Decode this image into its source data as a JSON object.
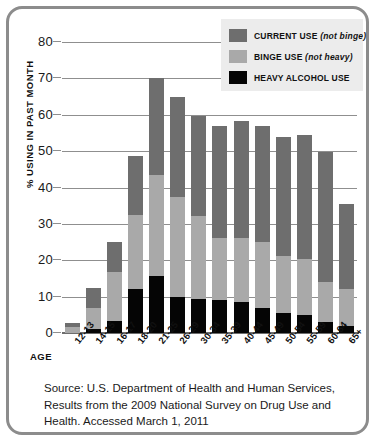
{
  "chart_data": {
    "type": "bar",
    "stacked": true,
    "title": "",
    "xlabel": "AGE",
    "ylabel": "% USING IN PAST MONTH",
    "ylim": [
      0,
      80
    ],
    "yticks": [
      0,
      10,
      20,
      30,
      40,
      50,
      60,
      70,
      80
    ],
    "grid": true,
    "legend_position": "top-right",
    "categories": [
      "12-13",
      "14-15",
      "16-17",
      "18-20",
      "21-25",
      "26-29",
      "30-34",
      "35-39",
      "40-44",
      "45-49",
      "50-54",
      "55-59",
      "60-64",
      "65+"
    ],
    "series": [
      {
        "name": "HEAVY ALCOHOL USE",
        "color": "#050505",
        "values": [
          0.0,
          1.2,
          3.2,
          12.0,
          15.8,
          9.8,
          9.3,
          9.0,
          8.5,
          7.0,
          5.6,
          4.9,
          3.1,
          1.8
        ]
      },
      {
        "name": "BINGE USE",
        "note": "(not heavy)",
        "color": "#a9a9a9",
        "values": [
          1.6,
          5.6,
          13.5,
          20.5,
          27.7,
          27.7,
          22.9,
          17.2,
          17.6,
          18.0,
          15.7,
          15.5,
          10.8,
          10.3
        ]
      },
      {
        "name": "CURRENT USE",
        "note": "(not binge)",
        "color": "#6e6e6e",
        "values": [
          1.2,
          5.7,
          8.2,
          16.3,
          26.5,
          27.5,
          27.4,
          30.8,
          32.1,
          31.8,
          32.7,
          34.0,
          35.9,
          23.4
        ]
      }
    ],
    "totals": [
      2.8,
      12.5,
      24.9,
      48.8,
      70.0,
      65.0,
      59.6,
      57.0,
      58.2,
      56.8,
      54.0,
      54.4,
      49.8,
      35.5
    ]
  },
  "legend": {
    "items": [
      {
        "label": "CURRENT USE",
        "note": "(not binge)",
        "color": "#6e6e6e"
      },
      {
        "label": "BINGE USE",
        "note": "(not heavy)",
        "color": "#a9a9a9"
      },
      {
        "label": "HEAVY ALCOHOL USE",
        "note": "",
        "color": "#050505"
      }
    ]
  },
  "axis": {
    "age_label": "AGE",
    "y_title": "% USING IN PAST MONTH"
  },
  "caption": {
    "line1": "Source: U.S. Department of Health and Human Services,",
    "line2": "Results from the 2009 National Survey on Drug Use and",
    "line3": "Health. Accessed March 1, 2011"
  },
  "colors": {
    "current_use": "#6e6e6e",
    "binge_use": "#a9a9a9",
    "heavy_use": "#050505",
    "gridline": "#8f8f8f",
    "frame": "#8c8c8c",
    "legend_bg": "#ececec"
  }
}
